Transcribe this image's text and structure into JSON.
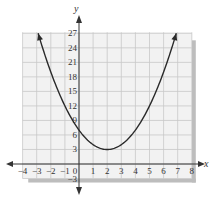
{
  "chart_data": {
    "type": "line",
    "title": "",
    "xlabel": "x",
    "ylabel": "y",
    "function": "y = (x - 2)^2 + 3",
    "vertex": [
      2,
      3
    ],
    "xlim": [
      -4,
      8
    ],
    "ylim": [
      -3,
      27
    ],
    "x_ticks": [
      -4,
      -3,
      -2,
      -1,
      0,
      1,
      2,
      3,
      4,
      5,
      6,
      7,
      8
    ],
    "y_ticks": [
      -3,
      3,
      6,
      9,
      12,
      15,
      18,
      21,
      24,
      27
    ],
    "grid": true,
    "series": [
      {
        "name": "parabola",
        "x": [
          -2.9,
          -2,
          -1,
          0,
          1,
          2,
          3,
          4,
          5,
          6,
          6.9
        ],
        "y": [
          27,
          19,
          12,
          7,
          4,
          3,
          4,
          7,
          12,
          19,
          27
        ]
      }
    ],
    "colors": {
      "curve": "#2a2a2a",
      "grid": "#c8c8c8",
      "axis": "#333333",
      "background": "#f2f2f2",
      "shadow": "#bdbdbd"
    }
  }
}
